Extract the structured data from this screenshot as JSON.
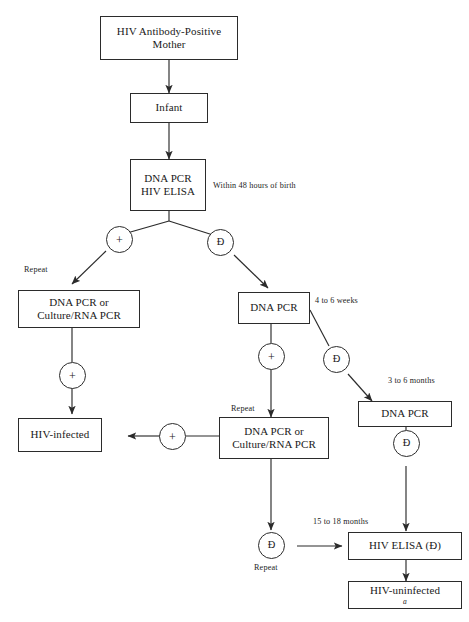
{
  "diagram": {
    "stroke_color": "#2b2b2b",
    "background_color": "#ffffff",
    "nodes": [
      {
        "id": "mother",
        "line1": "HIV Antibody-Positive",
        "line2": "Mother"
      },
      {
        "id": "infant",
        "line1": "Infant",
        "line2": ""
      },
      {
        "id": "birth_test",
        "line1": "DNA PCR",
        "line2": "HIV ELISA"
      },
      {
        "id": "left_repeat",
        "line1": "DNA PCR or",
        "line2": "Culture/RNA PCR"
      },
      {
        "id": "dna_pcr_mid",
        "line1": "DNA PCR",
        "line2": ""
      },
      {
        "id": "dna_pcr_right",
        "line1": "DNA PCR",
        "line2": ""
      },
      {
        "id": "hiv_infected",
        "line1": "HIV-infected",
        "line2": ""
      },
      {
        "id": "mid_repeat",
        "line1": "DNA PCR or",
        "line2": "Culture/RNA PCR"
      },
      {
        "id": "hiv_elisa_neg",
        "line1": "HIV ELISA (Ð)",
        "line2": ""
      },
      {
        "id": "hiv_uninf",
        "line1": "HIV-uninfected",
        "line2": "",
        "superscript": "a"
      }
    ],
    "result_circles": [
      {
        "id": "c_birth_pos",
        "label": "+"
      },
      {
        "id": "c_birth_neg",
        "label": "Ð"
      },
      {
        "id": "c_left_pos",
        "label": "+"
      },
      {
        "id": "c_mid_pos",
        "label": "+"
      },
      {
        "id": "c_mid_neg",
        "label": "Ð"
      },
      {
        "id": "c_to_infect",
        "label": "+"
      },
      {
        "id": "c_right_neg",
        "label": "Ð"
      },
      {
        "id": "c_bottom_neg",
        "label": "Ð"
      }
    ],
    "annotations": [
      {
        "id": "ann_birth",
        "text": "Within 48 hours of birth"
      },
      {
        "id": "ann_repeat_1",
        "text": "Repeat"
      },
      {
        "id": "ann_4to6weeks",
        "text": "4 to 6 weeks"
      },
      {
        "id": "ann_3to6months",
        "text": "3 to 6 months"
      },
      {
        "id": "ann_repeat_2",
        "text": "Repeat"
      },
      {
        "id": "ann_15to18",
        "text": "15 to 18 months"
      },
      {
        "id": "ann_repeat_3",
        "text": "Repeat"
      }
    ]
  }
}
